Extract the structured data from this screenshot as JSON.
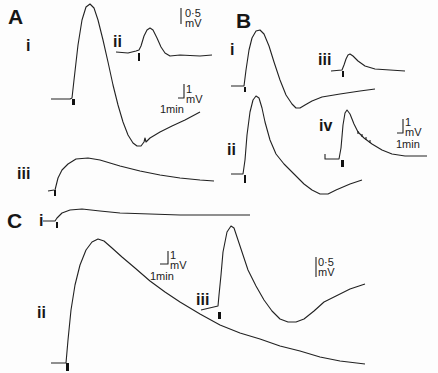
{
  "panels": {
    "A": {
      "label": "A",
      "traces": [
        {
          "label": "i"
        },
        {
          "label": "ii"
        },
        {
          "label": "iii"
        }
      ],
      "scale_bars": [
        {
          "value": "0·5",
          "unit": "mV"
        },
        {
          "value": "1",
          "unit": "mV",
          "time": "1min"
        }
      ]
    },
    "B": {
      "label": "B",
      "traces": [
        {
          "label": "i"
        },
        {
          "label": "ii"
        },
        {
          "label": "iii"
        },
        {
          "label": "iv"
        }
      ],
      "scale_bars": [
        {
          "value": "1",
          "unit": "mV",
          "time": "1min"
        }
      ]
    },
    "C": {
      "label": "C",
      "traces": [
        {
          "label": "i"
        },
        {
          "label": "ii"
        },
        {
          "label": "iii"
        }
      ],
      "scale_bars": [
        {
          "value": "1",
          "unit": "mV",
          "time": "1min"
        },
        {
          "value": "0·5",
          "unit": "mV"
        }
      ]
    }
  },
  "colors": {
    "ink": "#222222",
    "background": "#fdfdfd"
  }
}
